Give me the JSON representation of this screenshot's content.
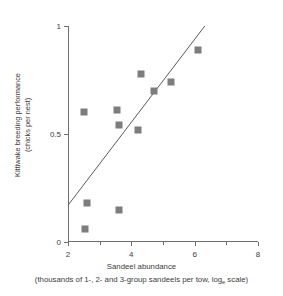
{
  "chart_data": {
    "type": "scatter",
    "title": "",
    "xlabel": "Sandeel abundance",
    "xsublabel_pre": "(thousands of 1-, 2- and 3-group sandeels per tow, log",
    "xsublabel_sub": "e",
    "xsublabel_post": " scale)",
    "ylabel_line1": "Kittiwake breeding performance",
    "ylabel_line2": "(chicks per nest)",
    "xlim": [
      2,
      8
    ],
    "ylim": [
      0,
      1
    ],
    "grid": false,
    "legend": "none",
    "xticks": [
      {
        "value": 2,
        "label": "2",
        "minor": false
      },
      {
        "value": 3,
        "label": "",
        "minor": true
      },
      {
        "value": 4,
        "label": "4",
        "minor": false
      },
      {
        "value": 5,
        "label": "",
        "minor": true
      },
      {
        "value": 6,
        "label": "6",
        "minor": false
      },
      {
        "value": 7,
        "label": "",
        "minor": true
      },
      {
        "value": 8,
        "label": "8",
        "minor": false
      }
    ],
    "yticks": [
      {
        "value": 0,
        "label": "0"
      },
      {
        "value": 0.5,
        "label": "0.5"
      },
      {
        "value": 1,
        "label": "1"
      }
    ],
    "marker": {
      "shape": "square",
      "color": "#7d7d7d",
      "size": 7
    },
    "points": [
      {
        "x": 2.5,
        "y": 0.6
      },
      {
        "x": 2.6,
        "y": 0.18
      },
      {
        "x": 2.55,
        "y": 0.06
      },
      {
        "x": 3.55,
        "y": 0.61
      },
      {
        "x": 3.6,
        "y": 0.54
      },
      {
        "x": 3.6,
        "y": 0.15
      },
      {
        "x": 4.2,
        "y": 0.52
      },
      {
        "x": 4.3,
        "y": 0.78
      },
      {
        "x": 4.7,
        "y": 0.7
      },
      {
        "x": 5.25,
        "y": 0.74
      },
      {
        "x": 6.1,
        "y": 0.89
      }
    ],
    "fit_line": {
      "x1": 2.0,
      "y1": 0.17,
      "x2": 6.32,
      "y2": 1.0,
      "color": "#5a5a5a",
      "width": 1
    }
  }
}
